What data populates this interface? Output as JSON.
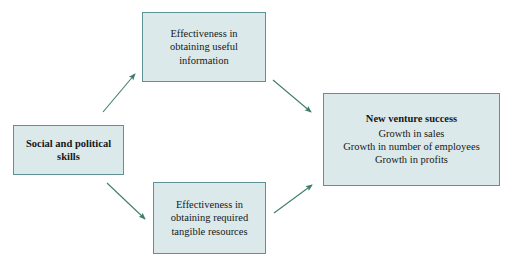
{
  "diagram": {
    "type": "flowchart",
    "background_color": "#ffffff",
    "box_fill_color": "#dce9ea",
    "box_border_color": "#5e9396",
    "arrow_color": "#3f7d6b",
    "text_color": "#14181a",
    "nodes": [
      {
        "id": "skills",
        "name": "social-and-political-skills",
        "bold": true,
        "lines": [
          "Social and political",
          "skills"
        ]
      },
      {
        "id": "information",
        "name": "effectiveness-obtaining-useful-information",
        "bold": false,
        "lines": [
          "Effectiveness in",
          "obtaining useful",
          "information"
        ]
      },
      {
        "id": "resources",
        "name": "effectiveness-obtaining-tangible-resources",
        "bold": false,
        "lines": [
          "Effectiveness in",
          "obtaining required",
          "tangible resources"
        ]
      },
      {
        "id": "success",
        "name": "new-venture-success",
        "bold": false,
        "lines": [
          "New venture success",
          "Growth in sales",
          "Growth in number of employees",
          "Growth in profits"
        ]
      }
    ],
    "arrows": [
      {
        "name": "arrow-skills-to-information",
        "from": "skills",
        "to": "information",
        "direction": "up-right"
      },
      {
        "name": "arrow-skills-to-resources",
        "from": "skills",
        "to": "resources",
        "direction": "down-right"
      },
      {
        "name": "arrow-information-to-success",
        "from": "information",
        "to": "success",
        "direction": "down-right"
      },
      {
        "name": "arrow-resources-to-success",
        "from": "resources",
        "to": "success",
        "direction": "up-right"
      }
    ]
  }
}
